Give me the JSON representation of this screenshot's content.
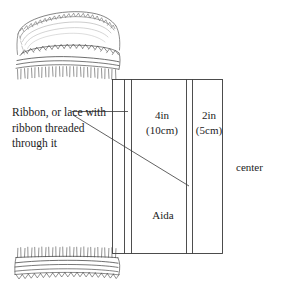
{
  "figure": {
    "background_color": "#ffffff",
    "line_color": "#3a3a3a",
    "sketch_color": "#555555"
  },
  "callout": {
    "text": "Ribbon, or lace with ribbon threaded through it"
  },
  "labels": {
    "band_wide": "4in\n(10cm)",
    "band_wide_inches": "4in",
    "band_wide_metric": "(10cm)",
    "band_narrow": "2in",
    "band_narrow_metric": "(5cm)",
    "fabric": "Aida",
    "center": "center"
  },
  "measurements": {
    "wide_panel_in": 4,
    "wide_panel_cm": 10,
    "narrow_panel_in": 2,
    "narrow_panel_cm": 5
  },
  "illustrations": {
    "top": "fabric-edge-with-lace-and-fringe",
    "bottom": "fabric-edge-with-fringe-and-scalloped-lace"
  }
}
